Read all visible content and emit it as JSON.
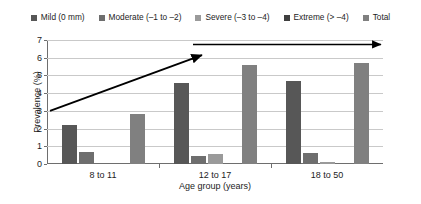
{
  "chart_data": {
    "type": "bar",
    "title": "",
    "xlabel": "Age group (years)",
    "ylabel": "Prevalence (%)",
    "categories": [
      "8 to 11",
      "12 to 17",
      "18 to 50"
    ],
    "ylim": [
      0,
      7
    ],
    "yticks": [
      0,
      1,
      2,
      3,
      4,
      5,
      6,
      7
    ],
    "grid": true,
    "legend_position": "top",
    "series": [
      {
        "name": "Mild (0 mm)",
        "color": "#575757",
        "values": [
          2.2,
          4.55,
          4.7
        ]
      },
      {
        "name": "Moderate (–1 to –2)",
        "color": "#6e6e6e",
        "values": [
          0.7,
          0.45,
          0.6
        ]
      },
      {
        "name": "Severe (–3 to –4)",
        "color": "#9a9a9a",
        "values": [
          0.0,
          0.55,
          0.1
        ]
      },
      {
        "name": "Extreme (> –4)",
        "color": "#3f3f3f",
        "values": [
          0.0,
          0.0,
          0.0
        ]
      },
      {
        "name": "Total",
        "color": "#808080",
        "values": [
          2.85,
          5.6,
          5.7
        ]
      }
    ],
    "annotations": [
      {
        "name": "rising-trend-arrow",
        "type": "arrow",
        "x1": 3,
        "y1": 3.0,
        "x2": 155,
        "y2": 6.15
      },
      {
        "name": "horizontal-trend-arrow",
        "type": "arrow",
        "x1": 146,
        "y1": 6.75,
        "x2": 334,
        "y2": 6.75
      }
    ]
  }
}
